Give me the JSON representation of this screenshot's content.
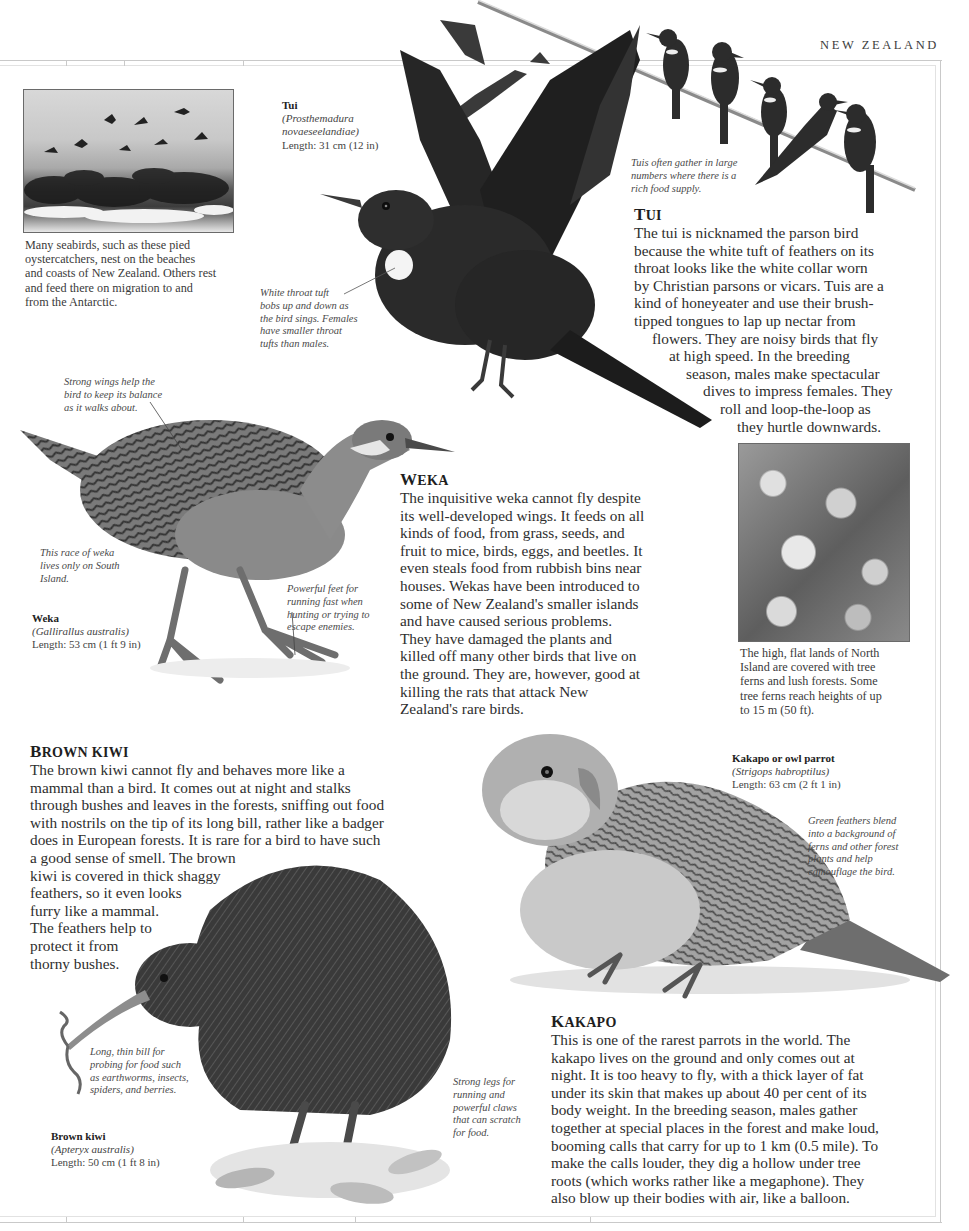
{
  "page": {
    "running_head": "NEW ZEALAND"
  },
  "seabirds_photo": {
    "caption_lines": [
      "Many seabirds, such as these pied",
      "oystercatchers, nest on the beaches",
      "and coasts of New Zealand. Others rest",
      "and feed there on migration to and",
      "from the Antarctic."
    ]
  },
  "tui": {
    "label": {
      "name": "Tui",
      "latin_line1": "(Prosthemadura",
      "latin_line2": "novaeseelandiae)",
      "length": "Length: 31 cm (12 in)"
    },
    "annotation_throat_lines": [
      "White throat tuft",
      "bobs up and down as",
      "the bird sings. Females",
      "have smaller throat",
      "tufts than males."
    ],
    "annotation_flock_lines": [
      "Tuis often gather in large",
      "numbers where there is a",
      "rich food supply."
    ],
    "heading_cap": "T",
    "heading_rest": "UI",
    "body_lines": [
      "The tui is nicknamed the parson bird",
      "because the white tuft of feathers on its",
      "throat looks like the white collar worn",
      "by Christian parsons or vicars. Tuis are a",
      "kind of honeyeater and use their brush-",
      "tipped tongues to lap up nectar from",
      "flowers. They are noisy birds that fly",
      "at high speed. In the breeding",
      "season, males make spectacular",
      "dives to impress females. They",
      "roll and loop-the-loop as",
      "they hurtle downwards."
    ]
  },
  "weka": {
    "annotation_wings_lines": [
      "Strong wings help the",
      "bird to keep its balance",
      "as it walks about."
    ],
    "annotation_race_lines": [
      "This race of weka",
      "lives only on South",
      "Island."
    ],
    "annotation_feet_lines": [
      "Powerful feet for",
      "running fast when",
      "hunting or trying to",
      "escape enemies."
    ],
    "label": {
      "name": "Weka",
      "latin": "(Gallirallus australis)",
      "length": "Length: 53 cm (1 ft 9 in)"
    },
    "heading_cap": "W",
    "heading_rest": "EKA",
    "body_lines": [
      "The inquisitive weka cannot fly despite",
      "its well-developed wings. It feeds on all",
      "kinds of food, from grass, seeds, and",
      "fruit to mice, birds, eggs, and beetles. It",
      "even steals food from rubbish bins near",
      "houses. Wekas have been introduced to",
      "some of New Zealand's smaller islands",
      "and have caused serious problems.",
      "They have damaged the plants and",
      "killed off many other birds that live on",
      "the ground. They are, however, good at",
      "killing the rats that attack New",
      "Zealand's rare birds."
    ]
  },
  "forest_photo": {
    "caption_lines": [
      "The high, flat lands of North",
      "Island are covered with tree",
      "ferns and lush forests. Some",
      "tree ferns reach heights of up",
      "to 15 m (50 ft)."
    ]
  },
  "brown_kiwi": {
    "heading_cap": "B",
    "heading_rest": "ROWN KIWI",
    "body_lines": [
      "The brown kiwi cannot fly and behaves more like a",
      "mammal than a bird. It comes out at night and stalks",
      "through bushes and leaves in the forests, sniffing out food",
      "with nostrils on the tip of its long bill, rather like a badger",
      "does in European forests. It is rare for a bird to have such",
      "a good sense of smell. The brown",
      "kiwi is covered in thick shaggy",
      "feathers, so it even looks",
      "furry like a mammal.",
      "The feathers help to",
      "protect it from",
      "thorny bushes."
    ],
    "annotation_bill_lines": [
      "Long, thin bill for",
      "probing for food such",
      "as earthworms, insects,",
      "spiders, and berries."
    ],
    "annotation_legs_lines": [
      "Strong legs for",
      "running and",
      "powerful claws",
      "that can scratch",
      "for food."
    ],
    "label": {
      "name": "Brown kiwi",
      "latin": "(Apteryx australis)",
      "length": "Length: 50 cm (1 ft 8 in)"
    }
  },
  "kakapo": {
    "label": {
      "name": "Kakapo or owl parrot",
      "latin": "(Strigops habroptilus)",
      "length": "Length: 63 cm (2 ft 1 in)"
    },
    "annotation_feathers_lines": [
      "Green feathers blend",
      "into a background of",
      "ferns and other forest",
      "plants and help",
      "camouflage the bird."
    ],
    "heading_cap": "K",
    "heading_rest": "AKAPO",
    "body_lines": [
      "This is one of the rarest parrots in the world. The",
      "kakapo lives on the ground and only comes out at",
      "night. It is too heavy to fly, with a thick layer of fat",
      "under its skin that makes up about 40 per cent of its",
      "body weight. In the breeding season, males gather",
      "together at special places in the forest and make loud,",
      "booming calls that carry for up to 1 km (0.5 mile). To",
      "make the calls louder, they dig a hollow under tree",
      "roots (which works rather like a megaphone). They",
      "also blow up their bodies with air, like a balloon."
    ]
  }
}
